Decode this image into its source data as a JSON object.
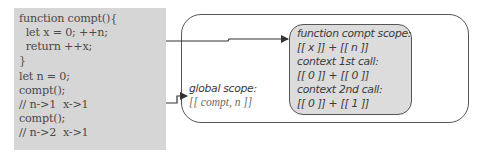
{
  "code_panel": {
    "background": "#d6d6d6",
    "lines": [
      "function compt(){",
      "  let x = 0; ++n;",
      "  return ++x;",
      "}",
      "let n = 0;",
      "compt();",
      "// n->1  x->1",
      "compt();",
      "// n->2  x->1"
    ]
  },
  "global_scope": {
    "title": "global scope:",
    "variables": "[[ compt, n ]]"
  },
  "function_scope": {
    "background": "#dcdcdc",
    "lines": [
      "function compt scope:",
      "[[ x ]] + [[ n ]]",
      "context 1st call:",
      "[[ 0 ]] + [[ 0 ]]",
      "context 2nd call:",
      "[[ 0 ]] + [[ 1 ]]"
    ]
  },
  "colors": {
    "stroke": "#555555",
    "code_text": "#4a4a4a",
    "scope_text": "#3a3a3a",
    "global_vars_text": "#6a6a6a"
  }
}
